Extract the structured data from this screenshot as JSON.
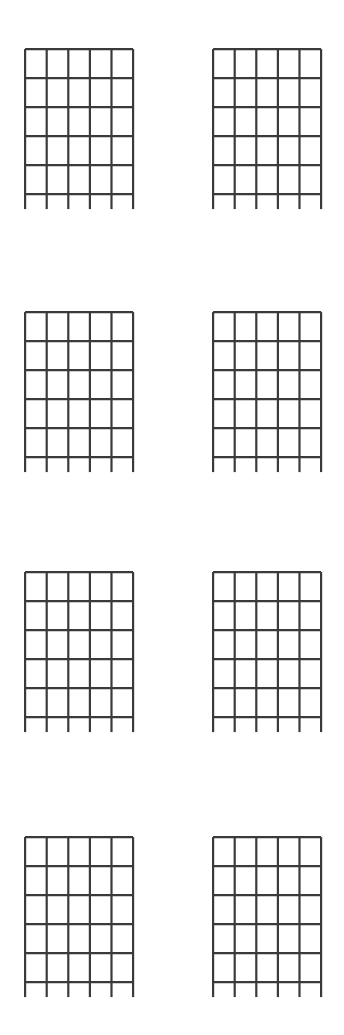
{
  "page": {
    "background_color": "#ffffff",
    "width": 344,
    "height": 1035,
    "text_content": "",
    "annotations": []
  },
  "diagram_style": {
    "line_color": "#3a3a3a",
    "line_width": 2.2,
    "string_count": 6,
    "fret_line_count": 6,
    "cell_columns": 5,
    "cell_rows": 5,
    "cell_width": 21.6,
    "cell_height": 29,
    "grid_width": 108,
    "grid_height": 145,
    "leg_length": 15
  },
  "layout": {
    "columns": 2,
    "rows": 4,
    "column_x": [
      24,
      212
    ],
    "row_y": [
      48,
      311,
      571,
      836
    ]
  },
  "diagrams": [
    {
      "id": "chord-diagram-1",
      "label": "",
      "row": 0,
      "col": 0,
      "x": 24,
      "y": 48,
      "markers": []
    },
    {
      "id": "chord-diagram-2",
      "label": "",
      "row": 0,
      "col": 1,
      "x": 212,
      "y": 48,
      "markers": []
    },
    {
      "id": "chord-diagram-3",
      "label": "",
      "row": 1,
      "col": 0,
      "x": 24,
      "y": 311,
      "markers": []
    },
    {
      "id": "chord-diagram-4",
      "label": "",
      "row": 1,
      "col": 1,
      "x": 212,
      "y": 311,
      "markers": []
    },
    {
      "id": "chord-diagram-5",
      "label": "",
      "row": 2,
      "col": 0,
      "x": 24,
      "y": 571,
      "markers": []
    },
    {
      "id": "chord-diagram-6",
      "label": "",
      "row": 2,
      "col": 1,
      "x": 212,
      "y": 571,
      "markers": []
    },
    {
      "id": "chord-diagram-7",
      "label": "",
      "row": 3,
      "col": 0,
      "x": 24,
      "y": 836,
      "markers": []
    },
    {
      "id": "chord-diagram-8",
      "label": "",
      "row": 3,
      "col": 1,
      "x": 212,
      "y": 836,
      "markers": []
    }
  ]
}
